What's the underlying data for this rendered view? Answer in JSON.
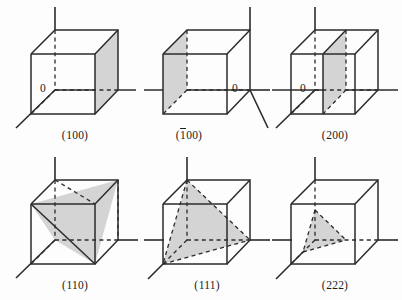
{
  "figure": {
    "background_color": "#fdfdfd",
    "line_color": "#2b2b2b",
    "shade_color": "#d4d4d4",
    "text_color": "#1b1b1b"
  },
  "cells": [
    {
      "id": "cell-100",
      "label_plain": "(100)",
      "label_prefix": "(",
      "label_bar": "",
      "label_rest": "100)",
      "origin_label": "0",
      "origin_position": "center-left",
      "plane_type": "face",
      "shaded_face": "right",
      "description": "Shaded plane is the right-hand cube face, intercepting the x axis at 1"
    },
    {
      "id": "cell-1bar00",
      "label_plain": "(100)",
      "label_prefix": "(",
      "label_bar": "1",
      "label_rest": "00)",
      "origin_label": "0",
      "origin_position": "center-right",
      "plane_type": "face",
      "shaded_face": "left",
      "description": "Shaded plane is the left-hand cube face, intercepting x at -1"
    },
    {
      "id": "cell-200",
      "label_plain": "(200)",
      "label_prefix": "(",
      "label_bar": "",
      "label_rest": "200)",
      "origin_label": "0",
      "origin_position": "center-left",
      "plane_type": "mid-section",
      "shaded_face": "middle-vertical",
      "description": "Shaded plane cuts the cell vertically at x = 1/2"
    },
    {
      "id": "cell-110",
      "label_plain": "(110)",
      "label_prefix": "(",
      "label_bar": "",
      "label_rest": "110)",
      "origin_label": "",
      "origin_position": "none",
      "plane_type": "diagonal-parallelogram",
      "shaded_face": "body-diagonal",
      "description": "Shaded plane is the diagonal parallelogram intercepting x and y at 1"
    },
    {
      "id": "cell-111",
      "label_plain": "(111)",
      "label_prefix": "(",
      "label_bar": "",
      "label_rest": "111)",
      "origin_label": "",
      "origin_position": "none",
      "plane_type": "triangle",
      "shaded_face": "corner-triangle-full",
      "description": "Shaded triangle intercepts all three axes at 1"
    },
    {
      "id": "cell-222",
      "label_plain": "(222)",
      "label_prefix": "(",
      "label_bar": "",
      "label_rest": "222)",
      "origin_label": "",
      "origin_position": "none",
      "plane_type": "triangle",
      "shaded_face": "corner-triangle-half",
      "description": "Shaded triangle intercepts all three axes at 1/2"
    }
  ]
}
